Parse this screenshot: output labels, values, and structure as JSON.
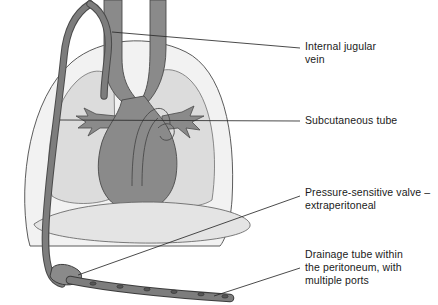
{
  "figure": {
    "background_color": "#ffffff",
    "colors": {
      "body_fill": "#f2f2f2",
      "lung_fill": "#dcdcdc",
      "abdomen_fill": "#e4e4e4",
      "heart_fill": "#8a8a8a",
      "vessel_fill": "#8a8a8a",
      "catheter_fill": "#7d7d7d",
      "outline": "#3c3c3c",
      "leader_line": "#2b2b2b",
      "text": "#1a1a1a"
    },
    "structures": [
      {
        "name": "thorax-outline",
        "fill": "#f2f2f2"
      },
      {
        "name": "left-lung",
        "fill": "#dcdcdc"
      },
      {
        "name": "right-lung",
        "fill": "#dcdcdc"
      },
      {
        "name": "heart",
        "fill": "#8a8a8a"
      },
      {
        "name": "pulmonary-vessels",
        "fill": "#8a8a8a"
      },
      {
        "name": "internal-jugular-vein-left",
        "fill": "#8a8a8a"
      },
      {
        "name": "internal-jugular-vein-right",
        "fill": "#8a8a8a"
      },
      {
        "name": "diaphragm-abdomen",
        "fill": "#e4e4e4"
      },
      {
        "name": "catheter-subcutaneous-tube",
        "fill": "#7d7d7d"
      },
      {
        "name": "pressure-sensitive-valve",
        "fill": "#7d7d7d"
      },
      {
        "name": "drainage-tube",
        "fill": "#7d7d7d"
      },
      {
        "name": "drainage-ports",
        "count": 6,
        "fill": "#5a5a5a"
      }
    ]
  },
  "labels": {
    "jugular": {
      "text": "Internal jugular\nvein",
      "lines": [
        "Internal jugular",
        "vein"
      ]
    },
    "subcutaneous": {
      "text": "Subcutaneous tube",
      "lines": [
        "Subcutaneous tube"
      ]
    },
    "valve": {
      "text": "Pressure-sensitive valve –\nextraperitoneal",
      "lines": [
        "Pressure-sensitive valve –",
        "extraperitoneal"
      ]
    },
    "drainage": {
      "text": "Drainage tube within\nthe peritoneum, with\nmultiple ports",
      "lines": [
        "Drainage tube within",
        "the peritoneum, with",
        "multiple ports"
      ]
    }
  }
}
